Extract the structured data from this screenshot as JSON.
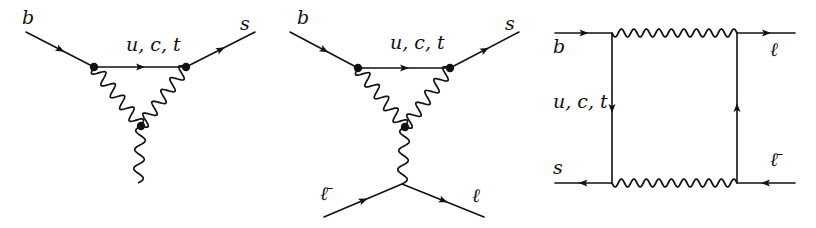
{
  "colors": {
    "ink": "#111111",
    "background": "#ffffff"
  },
  "diagrams": [
    {
      "name": "penguin-diagram-photon",
      "labels": [
        {
          "id": "b",
          "text": "b",
          "x": 22,
          "y": 8
        },
        {
          "id": "uct",
          "text": "u, c, t",
          "x": 126,
          "y": 35
        },
        {
          "id": "s",
          "text": "s",
          "x": 240,
          "y": 14
        }
      ],
      "fermions": [
        {
          "x1": 26,
          "y1": 32,
          "x2": 94,
          "y2": 67
        },
        {
          "x1": 94,
          "y1": 67,
          "x2": 186,
          "y2": 67
        },
        {
          "x1": 186,
          "y1": 67,
          "x2": 255,
          "y2": 32
        }
      ],
      "bosons": [
        {
          "x1": 94,
          "y1": 67,
          "x2": 141,
          "y2": 126,
          "n": 5,
          "amp": 6
        },
        {
          "x1": 186,
          "y1": 67,
          "x2": 141,
          "y2": 126,
          "n": 5,
          "amp": 6
        },
        {
          "x1": 141,
          "y1": 126,
          "x2": 138,
          "y2": 183,
          "n": 3,
          "amp": 5
        }
      ],
      "vertices": [
        [
          94,
          67
        ],
        [
          186,
          67
        ],
        [
          141,
          126
        ]
      ]
    },
    {
      "name": "penguin-diagram-leptons",
      "labels": [
        {
          "id": "b",
          "text": "b",
          "x": 297,
          "y": 8
        },
        {
          "id": "uct",
          "text": "u, c, t",
          "x": 390,
          "y": 33
        },
        {
          "id": "s",
          "text": "s",
          "x": 505,
          "y": 14
        },
        {
          "id": "lbar",
          "text": "ℓ̄",
          "x": 320,
          "y": 184
        },
        {
          "id": "l",
          "text": "ℓ",
          "x": 472,
          "y": 186
        }
      ],
      "fermions": [
        {
          "x1": 290,
          "y1": 32,
          "x2": 358,
          "y2": 68
        },
        {
          "x1": 358,
          "y1": 68,
          "x2": 450,
          "y2": 68
        },
        {
          "x1": 450,
          "y1": 68,
          "x2": 519,
          "y2": 32
        },
        {
          "x1": 324,
          "y1": 217,
          "x2": 402,
          "y2": 184
        },
        {
          "x1": 402,
          "y1": 184,
          "x2": 484,
          "y2": 217
        }
      ],
      "bosons": [
        {
          "x1": 358,
          "y1": 68,
          "x2": 405,
          "y2": 127,
          "n": 5,
          "amp": 6
        },
        {
          "x1": 450,
          "y1": 68,
          "x2": 405,
          "y2": 127,
          "n": 5,
          "amp": 6
        },
        {
          "x1": 405,
          "y1": 127,
          "x2": 402,
          "y2": 184,
          "n": 3,
          "amp": 5
        }
      ],
      "vertices": [
        [
          358,
          68
        ],
        [
          450,
          68
        ],
        [
          405,
          127
        ]
      ]
    },
    {
      "name": "box-diagram",
      "labels": [
        {
          "id": "b",
          "text": "b",
          "x": 553,
          "y": 37
        },
        {
          "id": "uct",
          "text": "u, c, t",
          "x": 553,
          "y": 92
        },
        {
          "id": "s",
          "text": "s",
          "x": 553,
          "y": 158
        },
        {
          "id": "l",
          "text": "ℓ",
          "x": 770,
          "y": 40
        },
        {
          "id": "lbar",
          "text": "ℓ̄",
          "x": 770,
          "y": 150
        }
      ],
      "fermions": [
        {
          "x1": 555,
          "y1": 33,
          "x2": 612,
          "y2": 33
        },
        {
          "x1": 612,
          "y1": 33,
          "x2": 612,
          "y2": 183
        },
        {
          "x1": 612,
          "y1": 183,
          "x2": 555,
          "y2": 183
        },
        {
          "x1": 737,
          "y1": 33,
          "x2": 795,
          "y2": 33
        },
        {
          "x1": 737,
          "y1": 183,
          "x2": 737,
          "y2": 33
        },
        {
          "x1": 795,
          "y1": 183,
          "x2": 737,
          "y2": 183
        }
      ],
      "bosons": [
        {
          "x1": 612,
          "y1": 33,
          "x2": 737,
          "y2": 33,
          "n": 10,
          "amp": 4
        },
        {
          "x1": 612,
          "y1": 183,
          "x2": 737,
          "y2": 183,
          "n": 10,
          "amp": 4
        }
      ],
      "vertices": []
    }
  ]
}
